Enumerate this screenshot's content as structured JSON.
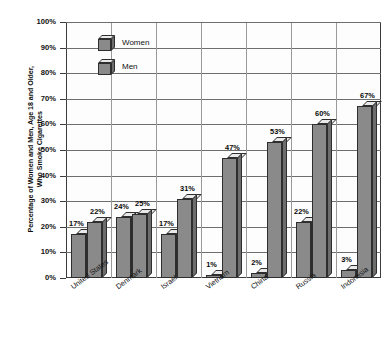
{
  "chart_data": {
    "type": "bar",
    "title": "",
    "subtitle": "",
    "xlabel": "",
    "ylabel": "Percentage of Women and Men, Age 18 and Older,\nWho Smoke Cigarettes",
    "categories": [
      "United States",
      "Denmark",
      "Israel",
      "Vietnam",
      "China",
      "Russia",
      "Indonesia"
    ],
    "series": [
      {
        "name": "Women",
        "values": [
          17,
          24,
          17,
          1,
          2,
          22,
          3
        ]
      },
      {
        "name": "Men",
        "values": [
          22,
          25,
          31,
          47,
          53,
          60,
          67
        ]
      }
    ],
    "value_labels": {
      "Women": [
        "17%",
        "24%",
        "17%",
        "1%",
        "2%",
        "22%",
        "3%"
      ],
      "Men": [
        "22%",
        "25%",
        "31%",
        "47%",
        "53%",
        "60%",
        "67%"
      ]
    },
    "ylim": [
      0,
      100
    ],
    "yticks": [
      0,
      10,
      20,
      30,
      40,
      50,
      60,
      70,
      80,
      90,
      100
    ],
    "ytick_labels": [
      "0%",
      "10%",
      "20%",
      "30%",
      "40%",
      "50%",
      "60%",
      "70%",
      "80%",
      "90%",
      "100%"
    ],
    "grid": true,
    "legend_position": "upper-left-inside",
    "colors": {
      "bar_front": "#8a8a8a",
      "bar_top": "#e9e9e9",
      "bar_side": "#6d6d6d",
      "bar_outline": "#2e2e2e",
      "gridline": "#6e6e6e",
      "frame": "#3b3b3b",
      "background": "#ffffff",
      "text": "#111111"
    }
  },
  "legend": {
    "items": [
      {
        "label": "Women",
        "icon": "cube-3d-icon"
      },
      {
        "label": "Men",
        "icon": "cube-3d-icon"
      }
    ]
  }
}
